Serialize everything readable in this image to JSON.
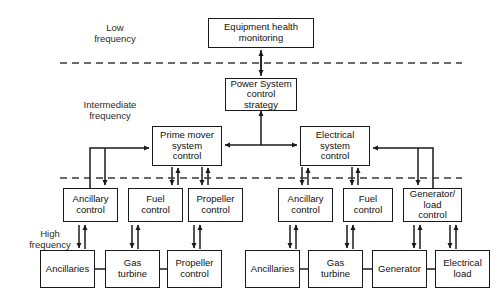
{
  "diagram": {
    "type": "block-diagram",
    "frequency_bands": [
      {
        "id": "low",
        "label": "Low\nfrequency",
        "x": 115,
        "y": 22
      },
      {
        "id": "intermediate",
        "label": "Intermediate\nfrequency",
        "x": 110,
        "y": 99
      },
      {
        "id": "high",
        "label": "High\nfrequency",
        "x": 50,
        "y": 228
      }
    ],
    "dividers": [
      {
        "id": "low-intermediate-divider",
        "x1": 60,
        "y1": 63,
        "x2": 462,
        "y2": 63
      },
      {
        "id": "intermediate-high-divider",
        "x1": 60,
        "y1": 178,
        "x2": 462,
        "y2": 178
      }
    ],
    "nodes": [
      {
        "id": "equipment-health-monitoring",
        "label": "Equipment health\nmonitoring",
        "x": 208,
        "y": 18,
        "w": 106,
        "h": 30
      },
      {
        "id": "power-system-control-strategy",
        "label": "Power System\ncontrol\nstrategy",
        "x": 225,
        "y": 78,
        "w": 72,
        "h": 32
      },
      {
        "id": "prime-mover-system-control",
        "label": "Prime mover\nsystem\ncontrol",
        "x": 152,
        "y": 126,
        "w": 70,
        "h": 39
      },
      {
        "id": "electrical-system-control",
        "label": "Electrical\nsystem\ncontrol",
        "x": 300,
        "y": 126,
        "w": 70,
        "h": 39
      },
      {
        "id": "pm-ancillary-control",
        "label": "Ancillary\ncontrol",
        "x": 63,
        "y": 188,
        "w": 55,
        "h": 34
      },
      {
        "id": "pm-fuel-control",
        "label": "Fuel\ncontrol",
        "x": 128,
        "y": 188,
        "w": 55,
        "h": 34
      },
      {
        "id": "pm-propeller-control",
        "label": "Propeller\ncontrol",
        "x": 188,
        "y": 188,
        "w": 55,
        "h": 34
      },
      {
        "id": "es-ancillary-control",
        "label": "Ancillary\ncontrol",
        "x": 278,
        "y": 188,
        "w": 55,
        "h": 34
      },
      {
        "id": "es-fuel-control",
        "label": "Fuel\ncontrol",
        "x": 343,
        "y": 188,
        "w": 50,
        "h": 34
      },
      {
        "id": "es-generator-load-control",
        "label": "Generator/\nload\ncontrol",
        "x": 403,
        "y": 188,
        "w": 59,
        "h": 34
      },
      {
        "id": "pm-ancillaries",
        "label": "Ancillaries",
        "x": 40,
        "y": 250,
        "w": 55,
        "h": 38
      },
      {
        "id": "pm-gas-turbine",
        "label": "Gas\nturbine",
        "x": 105,
        "y": 250,
        "w": 55,
        "h": 38
      },
      {
        "id": "pm-propeller",
        "label": "Propeller\ncontrol",
        "x": 167,
        "y": 250,
        "w": 55,
        "h": 38
      },
      {
        "id": "es-ancillaries",
        "label": "Ancillaries",
        "x": 245,
        "y": 250,
        "w": 55,
        "h": 38
      },
      {
        "id": "es-gas-turbine",
        "label": "Gas\nturbine",
        "x": 308,
        "y": 250,
        "w": 55,
        "h": 38
      },
      {
        "id": "es-generator",
        "label": "Generator",
        "x": 372,
        "y": 250,
        "w": 55,
        "h": 38
      },
      {
        "id": "es-electrical-load",
        "label": "Electrical\nload",
        "x": 435,
        "y": 250,
        "w": 55,
        "h": 38
      }
    ],
    "edges": [
      {
        "id": "edge-psc-to-ehm",
        "from": "power-system-control-strategy",
        "to": "equipment-health-monitoring",
        "arrows": "both"
      },
      {
        "id": "edge-tjunction-to-psc",
        "from": "hierarchy-junction",
        "to": "power-system-control-strategy",
        "arrows": "up"
      },
      {
        "id": "edge-junction-to-prime-mover",
        "from": "hierarchy-junction",
        "to": "prime-mover-system-control",
        "arrows": "left"
      },
      {
        "id": "edge-junction-to-electrical",
        "from": "hierarchy-junction",
        "to": "electrical-system-control",
        "arrows": "right"
      },
      {
        "id": "edge-pm-ancillary-feedback",
        "from": "pm-ancillary-control",
        "to": "prime-mover-system-control",
        "arrows": "both-lshape"
      },
      {
        "id": "edge-pm-fuel",
        "from": "pm-fuel-control",
        "to": "prime-mover-system-control",
        "arrows": "both"
      },
      {
        "id": "edge-pm-propeller",
        "from": "pm-propeller-control",
        "to": "prime-mover-system-control",
        "arrows": "both"
      },
      {
        "id": "edge-es-ancillary",
        "from": "es-ancillary-control",
        "to": "electrical-system-control",
        "arrows": "both"
      },
      {
        "id": "edge-es-fuel",
        "from": "es-fuel-control",
        "to": "electrical-system-control",
        "arrows": "both"
      },
      {
        "id": "edge-es-generator-load-feedback",
        "from": "es-generator-load-control",
        "to": "electrical-system-control",
        "arrows": "both-lshape"
      },
      {
        "id": "edge-pm-ancillaries",
        "from": "pm-ancillaries",
        "to": "pm-ancillary-control",
        "arrows": "both"
      },
      {
        "id": "edge-pm-gas-turbine",
        "from": "pm-gas-turbine",
        "to": "pm-fuel-control",
        "arrows": "both"
      },
      {
        "id": "edge-pm-propeller-plant",
        "from": "pm-propeller",
        "to": "pm-propeller-control",
        "arrows": "both"
      },
      {
        "id": "edge-es-ancillaries",
        "from": "es-ancillaries",
        "to": "es-ancillary-control",
        "arrows": "both"
      },
      {
        "id": "edge-es-gas-turbine",
        "from": "es-gas-turbine",
        "to": "es-fuel-control",
        "arrows": "both"
      },
      {
        "id": "edge-es-generator",
        "from": "es-generator",
        "to": "es-generator-load-control",
        "arrows": "both"
      },
      {
        "id": "edge-es-electrical-load",
        "from": "es-electrical-load",
        "to": "es-generator-load-control",
        "arrows": "both"
      },
      {
        "id": "link-pm-anc-gas",
        "from": "pm-ancillaries",
        "to": "pm-gas-turbine",
        "arrows": "none"
      },
      {
        "id": "link-pm-gas-prop",
        "from": "pm-gas-turbine",
        "to": "pm-propeller",
        "arrows": "none"
      },
      {
        "id": "link-es-anc-gas",
        "from": "es-ancillaries",
        "to": "es-gas-turbine",
        "arrows": "none"
      },
      {
        "id": "link-es-gas-gen",
        "from": "es-gas-turbine",
        "to": "es-generator",
        "arrows": "none"
      },
      {
        "id": "link-es-gen-load",
        "from": "es-generator",
        "to": "es-electrical-load",
        "arrows": "none"
      }
    ],
    "colors": {
      "line": "#1a1a1a",
      "divider": "#3a3a3a",
      "box_fill": "#ffffff",
      "text": "#111111"
    }
  }
}
